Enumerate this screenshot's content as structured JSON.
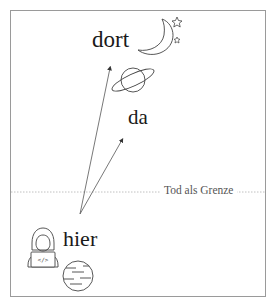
{
  "diagram": {
    "labels": {
      "far": "dort",
      "middle": "da",
      "near": "hier",
      "boundary": "Tod als Grenze"
    },
    "icons": {
      "far": [
        "moon-icon",
        "star-icon",
        "star-icon"
      ],
      "middle": [
        "ringed-planet-icon"
      ],
      "near": [
        "developer-avatar-icon",
        "earth-planet-icon"
      ]
    },
    "arrows": [
      {
        "from": "hier",
        "to": "dort"
      },
      {
        "from": "hier",
        "to": "da"
      }
    ],
    "colors": {
      "line": "#555555",
      "frame": "#9a9a9a",
      "boundary_line": "#b0b0b0",
      "text": "#1a1a1a"
    }
  }
}
